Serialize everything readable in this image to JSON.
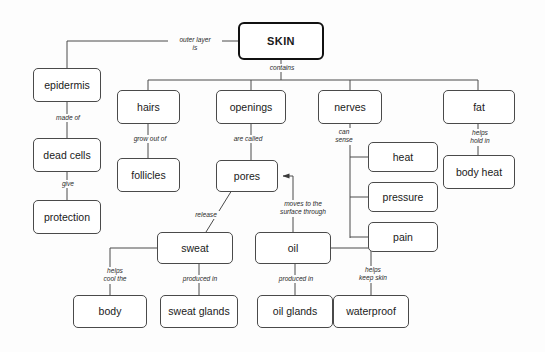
{
  "diagram": {
    "title": "SKIN",
    "type": "concept-map",
    "background_color": "#fdfdfd",
    "line_color": "#4a4a4a",
    "text_color": "#1a1a1a"
  },
  "nodes": [
    {
      "id": "skin",
      "label": "SKIN",
      "x": 238,
      "y": 22,
      "w": 86,
      "h": 38,
      "root": true
    },
    {
      "id": "epidermis",
      "label": "epidermis",
      "x": 33,
      "y": 68,
      "w": 68,
      "h": 34
    },
    {
      "id": "dead_cells",
      "label": "dead cells",
      "x": 33,
      "y": 138,
      "w": 68,
      "h": 34
    },
    {
      "id": "protection",
      "label": "protection",
      "x": 33,
      "y": 200,
      "w": 68,
      "h": 34
    },
    {
      "id": "hairs",
      "label": "hairs",
      "x": 117,
      "y": 90,
      "w": 63,
      "h": 34
    },
    {
      "id": "follicles",
      "label": "follicles",
      "x": 117,
      "y": 158,
      "w": 63,
      "h": 34
    },
    {
      "id": "openings",
      "label": "openings",
      "x": 216,
      "y": 90,
      "w": 70,
      "h": 34
    },
    {
      "id": "pores",
      "label": "pores",
      "x": 216,
      "y": 160,
      "w": 62,
      "h": 32
    },
    {
      "id": "nerves",
      "label": "nerves",
      "x": 318,
      "y": 90,
      "w": 64,
      "h": 34
    },
    {
      "id": "heat",
      "label": "heat",
      "x": 368,
      "y": 142,
      "w": 70,
      "h": 30
    },
    {
      "id": "pressure",
      "label": "pressure",
      "x": 368,
      "y": 182,
      "w": 70,
      "h": 30
    },
    {
      "id": "pain",
      "label": "pain",
      "x": 368,
      "y": 222,
      "w": 70,
      "h": 30
    },
    {
      "id": "fat",
      "label": "fat",
      "x": 443,
      "y": 90,
      "w": 72,
      "h": 34
    },
    {
      "id": "body_heat",
      "label": "body heat",
      "x": 443,
      "y": 155,
      "w": 72,
      "h": 34
    },
    {
      "id": "sweat",
      "label": "sweat",
      "x": 157,
      "y": 232,
      "w": 76,
      "h": 32
    },
    {
      "id": "oil",
      "label": "oil",
      "x": 255,
      "y": 232,
      "w": 76,
      "h": 32
    },
    {
      "id": "body",
      "label": "body",
      "x": 73,
      "y": 295,
      "w": 74,
      "h": 33
    },
    {
      "id": "sweat_glands",
      "label": "sweat glands",
      "x": 160,
      "y": 295,
      "w": 78,
      "h": 33
    },
    {
      "id": "oil_glands",
      "label": "oil glands",
      "x": 257,
      "y": 295,
      "w": 76,
      "h": 33
    },
    {
      "id": "waterproof",
      "label": "waterproof",
      "x": 333,
      "y": 295,
      "w": 76,
      "h": 33
    }
  ],
  "edge_labels": [
    {
      "id": "outer_layer_is",
      "text": "outer layer\nis",
      "x": 168,
      "y": 36,
      "w": 52
    },
    {
      "id": "contains",
      "text": "contains",
      "x": 258,
      "y": 64,
      "w": 46
    },
    {
      "id": "made_of",
      "text": "made of",
      "x": 44,
      "y": 114,
      "w": 46
    },
    {
      "id": "give",
      "text": "give",
      "x": 52,
      "y": 180,
      "w": 30
    },
    {
      "id": "grow_out_of",
      "text": "grow out of",
      "x": 122,
      "y": 135,
      "w": 54
    },
    {
      "id": "are_called",
      "text": "are called",
      "x": 222,
      "y": 135,
      "w": 50
    },
    {
      "id": "can_sense",
      "text": "can\nsense",
      "x": 328,
      "y": 128,
      "w": 30
    },
    {
      "id": "helps_hold_in",
      "text": "helps\nhold in",
      "x": 461,
      "y": 129,
      "w": 36
    },
    {
      "id": "release",
      "text": "release",
      "x": 186,
      "y": 211,
      "w": 38
    },
    {
      "id": "moves_to_surface",
      "text": "moves to the\nsurface through",
      "x": 271,
      "y": 200,
      "w": 62
    },
    {
      "id": "helps_cool_the",
      "text": "helps\ncool the",
      "x": 96,
      "y": 267,
      "w": 36
    },
    {
      "id": "produced_in_sweat",
      "text": "produced in",
      "x": 172,
      "y": 275,
      "w": 54
    },
    {
      "id": "produced_in_oil",
      "text": "produced in",
      "x": 268,
      "y": 275,
      "w": 54
    },
    {
      "id": "helps_keep_skin",
      "text": "helps\nkeep skin",
      "x": 351,
      "y": 266,
      "w": 42
    }
  ],
  "edges": [
    {
      "id": "skin-epidermis",
      "from": "skin",
      "to": "epidermis",
      "label": "outer_layer_is"
    },
    {
      "id": "skin-contains",
      "from": "skin",
      "to": "bus",
      "label": "contains"
    },
    {
      "id": "epidermis-dead",
      "from": "epidermis",
      "to": "dead_cells",
      "label": "made_of"
    },
    {
      "id": "dead-protection",
      "from": "dead_cells",
      "to": "protection",
      "label": "give"
    },
    {
      "id": "hairs-follicles",
      "from": "hairs",
      "to": "follicles",
      "label": "grow_out_of"
    },
    {
      "id": "openings-pores",
      "from": "openings",
      "to": "pores",
      "label": "are_called"
    },
    {
      "id": "nerves-heat",
      "from": "nerves",
      "to": "heat",
      "label": "can_sense"
    },
    {
      "id": "nerves-pressure",
      "from": "nerves",
      "to": "pressure",
      "label": "can_sense"
    },
    {
      "id": "nerves-pain",
      "from": "nerves",
      "to": "pain",
      "label": "can_sense"
    },
    {
      "id": "fat-bodyheat",
      "from": "fat",
      "to": "body_heat",
      "label": "helps_hold_in"
    },
    {
      "id": "pores-sweat",
      "from": "pores",
      "to": "sweat",
      "label": "release"
    },
    {
      "id": "oil-pores",
      "from": "oil",
      "to": "pores",
      "label": "moves_to_surface",
      "arrow": true
    },
    {
      "id": "sweat-body",
      "from": "sweat",
      "to": "body",
      "label": "helps_cool_the"
    },
    {
      "id": "sweat-glands",
      "from": "sweat",
      "to": "sweat_glands",
      "label": "produced_in_sweat"
    },
    {
      "id": "oil-glands",
      "from": "oil",
      "to": "oil_glands",
      "label": "produced_in_oil"
    },
    {
      "id": "oil-waterproof",
      "from": "oil",
      "to": "waterproof",
      "label": "helps_keep_skin"
    }
  ]
}
